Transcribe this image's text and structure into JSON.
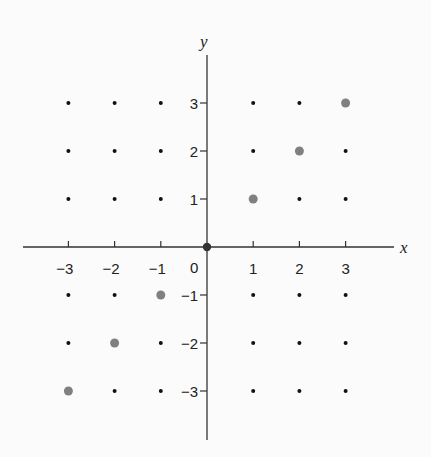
{
  "chart_data": {
    "type": "scatter",
    "title": "",
    "xlabel": "x",
    "ylabel": "y",
    "xlim": [
      -3,
      3
    ],
    "ylim": [
      -3,
      3
    ],
    "x_ticks": [
      "-3",
      "-2",
      "-1",
      "0",
      "1",
      "2",
      "3"
    ],
    "y_ticks": [
      "3",
      "2",
      "1",
      "-1",
      "-2",
      "-3"
    ],
    "grid_points": {
      "description": "integer lattice points (x,y) for x,y in -3..3, drawn as small black dots",
      "x_range": [
        -3,
        3
      ],
      "y_range": [
        -3,
        3
      ]
    },
    "highlighted_points": [
      {
        "x": -3,
        "y": -3
      },
      {
        "x": -2,
        "y": -2
      },
      {
        "x": -1,
        "y": -1
      },
      {
        "x": 0,
        "y": 0
      },
      {
        "x": 1,
        "y": 1
      },
      {
        "x": 2,
        "y": 2
      },
      {
        "x": 3,
        "y": 3
      }
    ],
    "colors": {
      "lattice_dot": "#111111",
      "highlight_dot": "#808080",
      "origin_dot": "#333333",
      "axis": "#333333"
    },
    "grid": false,
    "legend": null
  },
  "axes": {
    "x_label": "x",
    "y_label": "y",
    "origin_label": "0"
  }
}
